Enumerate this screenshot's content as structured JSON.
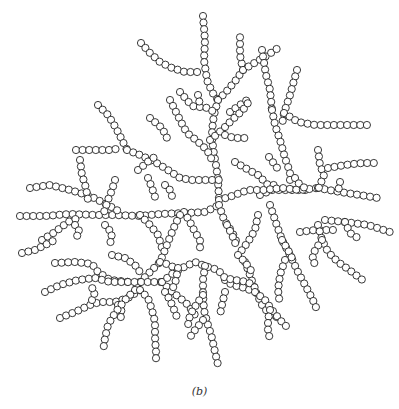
{
  "figure": {
    "caption": "(b)",
    "bead_radius": 3.6,
    "bead_spacing": 6.6,
    "stroke_color": "#222222",
    "fill_color": "#ffffff",
    "branches": [
      [
        [
          203,
          16
        ],
        [
          205,
          40
        ],
        [
          204,
          60
        ],
        [
          207,
          80
        ],
        [
          212,
          92
        ],
        [
          218,
          100
        ]
      ],
      [
        [
          141,
          43
        ],
        [
          150,
          53
        ],
        [
          160,
          62
        ],
        [
          172,
          68
        ],
        [
          185,
          72
        ],
        [
          198,
          72
        ],
        [
          203,
          70
        ]
      ],
      [
        [
          218,
          100
        ],
        [
          226,
          92
        ],
        [
          236,
          80
        ],
        [
          243,
          70
        ]
      ],
      [
        [
          243,
          70
        ],
        [
          240,
          55
        ],
        [
          240,
          36
        ]
      ],
      [
        [
          243,
          70
        ],
        [
          256,
          62
        ],
        [
          268,
          55
        ],
        [
          278,
          48
        ]
      ],
      [
        [
          218,
          100
        ],
        [
          214,
          115
        ],
        [
          212,
          130
        ],
        [
          213,
          148
        ],
        [
          216,
          165
        ],
        [
          218,
          180
        ],
        [
          219,
          200
        ]
      ],
      [
        [
          180,
          92
        ],
        [
          192,
          106
        ],
        [
          208,
          108
        ],
        [
          214,
          112
        ]
      ],
      [
        [
          198,
          95
        ],
        [
          200,
          105
        ]
      ],
      [
        [
          230,
          112
        ],
        [
          240,
          105
        ],
        [
          250,
          98
        ]
      ],
      [
        [
          210,
          140
        ],
        [
          222,
          130
        ],
        [
          232,
          120
        ],
        [
          243,
          110
        ],
        [
          250,
          100
        ]
      ],
      [
        [
          225,
          135
        ],
        [
          234,
          138
        ],
        [
          245,
          138
        ]
      ],
      [
        [
          170,
          100
        ],
        [
          175,
          110
        ],
        [
          180,
          120
        ],
        [
          187,
          133
        ],
        [
          196,
          140
        ],
        [
          207,
          150
        ],
        [
          212,
          160
        ]
      ],
      [
        [
          150,
          118
        ],
        [
          162,
          128
        ],
        [
          168,
          140
        ]
      ],
      [
        [
          98,
          105
        ],
        [
          108,
          115
        ],
        [
          116,
          128
        ],
        [
          122,
          140
        ],
        [
          127,
          150
        ]
      ],
      [
        [
          76,
          150
        ],
        [
          90,
          150
        ],
        [
          110,
          150
        ],
        [
          122,
          148
        ]
      ],
      [
        [
          127,
          150
        ],
        [
          140,
          155
        ],
        [
          155,
          162
        ],
        [
          168,
          170
        ],
        [
          180,
          178
        ],
        [
          192,
          180
        ],
        [
          200,
          180
        ],
        [
          210,
          180
        ],
        [
          219,
          180
        ]
      ],
      [
        [
          138,
          170
        ],
        [
          150,
          160
        ],
        [
          158,
          155
        ]
      ],
      [
        [
          148,
          178
        ],
        [
          152,
          188
        ],
        [
          155,
          197
        ]
      ],
      [
        [
          165,
          185
        ],
        [
          170,
          190
        ],
        [
          172,
          196
        ]
      ],
      [
        [
          262,
          50
        ],
        [
          266,
          75
        ],
        [
          270,
          90
        ],
        [
          272,
          110
        ]
      ],
      [
        [
          297,
          70
        ],
        [
          290,
          95
        ],
        [
          284,
          113
        ],
        [
          282,
          125
        ]
      ],
      [
        [
          272,
          110
        ],
        [
          275,
          125
        ],
        [
          280,
          140
        ],
        [
          285,
          158
        ],
        [
          290,
          172
        ],
        [
          290,
          185
        ]
      ],
      [
        [
          284,
          113
        ],
        [
          298,
          122
        ],
        [
          315,
          125
        ],
        [
          340,
          125
        ],
        [
          372,
          125
        ]
      ],
      [
        [
          235,
          162
        ],
        [
          245,
          168
        ],
        [
          258,
          175
        ],
        [
          268,
          185
        ],
        [
          278,
          185
        ]
      ],
      [
        [
          269,
          157
        ],
        [
          275,
          165
        ],
        [
          280,
          172
        ]
      ],
      [
        [
          260,
          195
        ],
        [
          272,
          190
        ],
        [
          282,
          190
        ],
        [
          296,
          190
        ],
        [
          308,
          190
        ]
      ],
      [
        [
          219,
          200
        ],
        [
          232,
          196
        ],
        [
          248,
          190
        ],
        [
          264,
          190
        ],
        [
          282,
          188
        ],
        [
          300,
          190
        ],
        [
          318,
          188
        ]
      ],
      [
        [
          318,
          188
        ],
        [
          340,
          192
        ],
        [
          360,
          195
        ],
        [
          378,
          198
        ]
      ],
      [
        [
          340,
          182
        ],
        [
          338,
          192
        ]
      ],
      [
        [
          318,
          150
        ],
        [
          320,
          165
        ],
        [
          324,
          175
        ],
        [
          318,
          190
        ]
      ],
      [
        [
          328,
          168
        ],
        [
          345,
          165
        ],
        [
          362,
          163
        ],
        [
          380,
          163
        ]
      ],
      [
        [
          295,
          178
        ],
        [
          300,
          185
        ],
        [
          308,
          190
        ]
      ],
      [
        [
          325,
          220
        ],
        [
          345,
          222
        ],
        [
          368,
          225
        ],
        [
          390,
          232
        ]
      ],
      [
        [
          345,
          222
        ],
        [
          350,
          233
        ],
        [
          358,
          238
        ]
      ],
      [
        [
          300,
          232
        ],
        [
          315,
          230
        ],
        [
          338,
          230
        ]
      ],
      [
        [
          20,
          216
        ],
        [
          45,
          216
        ],
        [
          70,
          214
        ],
        [
          95,
          215
        ],
        [
          115,
          215
        ],
        [
          140,
          216
        ],
        [
          160,
          214
        ],
        [
          185,
          213
        ],
        [
          205,
          212
        ],
        [
          219,
          205
        ]
      ],
      [
        [
          30,
          188
        ],
        [
          50,
          185
        ],
        [
          70,
          190
        ],
        [
          90,
          196
        ],
        [
          108,
          205
        ],
        [
          120,
          212
        ]
      ],
      [
        [
          80,
          160
        ],
        [
          82,
          175
        ],
        [
          86,
          188
        ],
        [
          88,
          200
        ]
      ],
      [
        [
          115,
          180
        ],
        [
          112,
          190
        ],
        [
          108,
          200
        ],
        [
          104,
          212
        ]
      ],
      [
        [
          42,
          240
        ],
        [
          55,
          232
        ],
        [
          68,
          222
        ],
        [
          78,
          218
        ]
      ],
      [
        [
          75,
          225
        ],
        [
          80,
          232
        ],
        [
          74,
          240
        ]
      ],
      [
        [
          105,
          225
        ],
        [
          112,
          233
        ],
        [
          110,
          245
        ]
      ],
      [
        [
          140,
          215
        ],
        [
          150,
          225
        ],
        [
          158,
          235
        ],
        [
          162,
          248
        ]
      ],
      [
        [
          219,
          205
        ],
        [
          224,
          220
        ],
        [
          232,
          232
        ],
        [
          238,
          245
        ]
      ],
      [
        [
          184,
          212
        ],
        [
          190,
          222
        ],
        [
          195,
          232
        ],
        [
          200,
          240
        ],
        [
          200,
          252
        ]
      ],
      [
        [
          227,
          225
        ],
        [
          232,
          235
        ],
        [
          236,
          245
        ]
      ],
      [
        [
          22,
          253
        ],
        [
          35,
          250
        ],
        [
          45,
          245
        ],
        [
          55,
          240
        ]
      ],
      [
        [
          180,
          215
        ],
        [
          175,
          225
        ],
        [
          170,
          237
        ],
        [
          165,
          250
        ],
        [
          160,
          262
        ],
        [
          150,
          272
        ],
        [
          140,
          282
        ],
        [
          135,
          290
        ]
      ],
      [
        [
          55,
          263
        ],
        [
          75,
          262
        ],
        [
          92,
          264
        ],
        [
          98,
          272
        ],
        [
          110,
          280
        ],
        [
          130,
          282
        ]
      ],
      [
        [
          45,
          292
        ],
        [
          60,
          285
        ],
        [
          78,
          280
        ],
        [
          95,
          278
        ],
        [
          110,
          282
        ],
        [
          130,
          282
        ],
        [
          150,
          282
        ],
        [
          162,
          282
        ]
      ],
      [
        [
          112,
          255
        ],
        [
          125,
          258
        ],
        [
          135,
          265
        ],
        [
          140,
          272
        ]
      ],
      [
        [
          160,
          262
        ],
        [
          170,
          265
        ],
        [
          180,
          272
        ]
      ],
      [
        [
          270,
          205
        ],
        [
          275,
          220
        ],
        [
          282,
          240
        ],
        [
          290,
          255
        ],
        [
          298,
          272
        ],
        [
          305,
          285
        ],
        [
          312,
          298
        ],
        [
          318,
          312
        ]
      ],
      [
        [
          258,
          215
        ],
        [
          255,
          230
        ],
        [
          248,
          242
        ],
        [
          238,
          255
        ]
      ],
      [
        [
          282,
          240
        ],
        [
          288,
          250
        ],
        [
          294,
          262
        ]
      ],
      [
        [
          318,
          225
        ],
        [
          322,
          240
        ],
        [
          328,
          252
        ],
        [
          338,
          262
        ],
        [
          352,
          272
        ],
        [
          365,
          282
        ]
      ],
      [
        [
          322,
          240
        ],
        [
          315,
          250
        ],
        [
          312,
          260
        ],
        [
          318,
          268
        ]
      ],
      [
        [
          285,
          260
        ],
        [
          280,
          275
        ],
        [
          278,
          290
        ],
        [
          280,
          305
        ]
      ],
      [
        [
          245,
          262
        ],
        [
          250,
          275
        ],
        [
          255,
          290
        ],
        [
          262,
          305
        ],
        [
          270,
          315
        ],
        [
          280,
          318
        ]
      ],
      [
        [
          238,
          255
        ],
        [
          245,
          262
        ],
        [
          252,
          272
        ]
      ],
      [
        [
          225,
          280
        ],
        [
          232,
          285
        ],
        [
          245,
          288
        ],
        [
          255,
          292
        ]
      ],
      [
        [
          60,
          318
        ],
        [
          75,
          312
        ],
        [
          90,
          305
        ],
        [
          100,
          302
        ],
        [
          115,
          302
        ],
        [
          128,
          298
        ],
        [
          140,
          290
        ]
      ],
      [
        [
          92,
          300
        ],
        [
          95,
          292
        ],
        [
          90,
          285
        ]
      ],
      [
        [
          118,
          305
        ],
        [
          122,
          312
        ],
        [
          120,
          320
        ]
      ],
      [
        [
          135,
          290
        ],
        [
          125,
          300
        ],
        [
          115,
          313
        ],
        [
          108,
          325
        ],
        [
          105,
          338
        ],
        [
          103,
          352
        ]
      ],
      [
        [
          162,
          282
        ],
        [
          170,
          290
        ],
        [
          180,
          298
        ],
        [
          188,
          305
        ],
        [
          195,
          315
        ]
      ],
      [
        [
          162,
          282
        ],
        [
          172,
          274
        ],
        [
          182,
          268
        ],
        [
          195,
          262
        ],
        [
          205,
          266
        ],
        [
          218,
          270
        ],
        [
          225,
          278
        ],
        [
          235,
          280
        ],
        [
          248,
          282
        ],
        [
          258,
          290
        ]
      ],
      [
        [
          178,
          268
        ],
        [
          176,
          280
        ],
        [
          172,
          290
        ]
      ],
      [
        [
          205,
          266
        ],
        [
          203,
          280
        ],
        [
          203,
          295
        ],
        [
          204,
          310
        ],
        [
          208,
          325
        ],
        [
          212,
          338
        ],
        [
          215,
          352
        ],
        [
          218,
          365
        ]
      ],
      [
        [
          140,
          290
        ],
        [
          148,
          298
        ],
        [
          152,
          310
        ],
        [
          155,
          322
        ],
        [
          155,
          337
        ],
        [
          156,
          352
        ],
        [
          156,
          364
        ]
      ],
      [
        [
          165,
          292
        ],
        [
          170,
          300
        ],
        [
          175,
          312
        ],
        [
          178,
          320
        ]
      ],
      [
        [
          203,
          295
        ],
        [
          196,
          305
        ],
        [
          190,
          315
        ],
        [
          188,
          325
        ]
      ],
      [
        [
          203,
          320
        ],
        [
          195,
          330
        ],
        [
          188,
          340
        ]
      ],
      [
        [
          255,
          292
        ],
        [
          265,
          300
        ],
        [
          272,
          310
        ],
        [
          280,
          320
        ],
        [
          290,
          330
        ]
      ],
      [
        [
          270,
          310
        ],
        [
          268,
          320
        ],
        [
          268,
          330
        ],
        [
          270,
          340
        ]
      ],
      [
        [
          225,
          292
        ],
        [
          222,
          305
        ],
        [
          220,
          315
        ]
      ]
    ]
  }
}
